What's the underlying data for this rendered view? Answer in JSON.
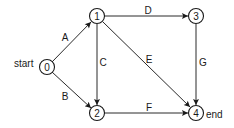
{
  "diagram": {
    "type": "directed-graph",
    "nodes": [
      {
        "id": "0",
        "label": "0",
        "x": 47,
        "y": 67,
        "tag": "start"
      },
      {
        "id": "1",
        "label": "1",
        "x": 97,
        "y": 16
      },
      {
        "id": "2",
        "label": "2",
        "x": 97,
        "y": 113
      },
      {
        "id": "3",
        "label": "3",
        "x": 196,
        "y": 16
      },
      {
        "id": "4",
        "label": "4",
        "x": 196,
        "y": 113,
        "tag": "end"
      }
    ],
    "edges": [
      {
        "label": "A",
        "from": "0",
        "to": "1"
      },
      {
        "label": "B",
        "from": "0",
        "to": "2"
      },
      {
        "label": "C",
        "from": "1",
        "to": "2"
      },
      {
        "label": "D",
        "from": "1",
        "to": "3"
      },
      {
        "label": "E",
        "from": "1",
        "to": "4"
      },
      {
        "label": "F",
        "from": "2",
        "to": "4"
      },
      {
        "label": "G",
        "from": "3",
        "to": "4"
      }
    ],
    "start_label": "start",
    "end_label": "end",
    "colors": {
      "stroke": "#1a1a1a",
      "background": "#ffffff"
    }
  },
  "labels": {
    "node0": "0",
    "node1": "1",
    "node2": "2",
    "node3": "3",
    "node4": "4",
    "edgeA": "A",
    "edgeB": "B",
    "edgeC": "C",
    "edgeD": "D",
    "edgeE": "E",
    "edgeF": "F",
    "edgeG": "G",
    "start": "start",
    "end": "end"
  }
}
